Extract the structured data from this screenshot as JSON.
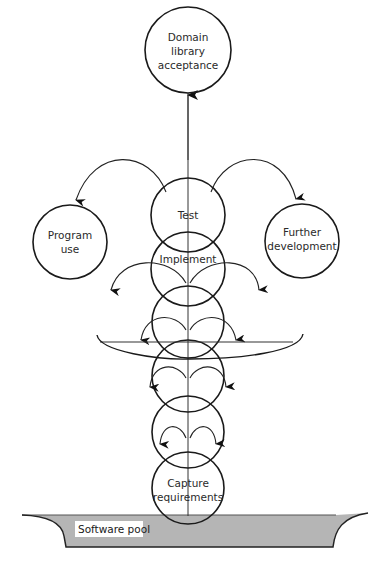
{
  "diagram": {
    "nodes": {
      "top": {
        "lines": [
          "Domain",
          "library",
          "acceptance"
        ]
      },
      "program_use": {
        "lines": [
          "Program",
          "use"
        ]
      },
      "further_development": {
        "lines": [
          "Further",
          "development"
        ]
      },
      "test": {
        "label": "Test"
      },
      "implement": {
        "label": "Implement"
      },
      "capture": {
        "lines": [
          "Capture",
          "requirements"
        ]
      }
    },
    "pool": {
      "label": "Software pool",
      "fill": "#b3b3b3"
    },
    "colors": {
      "stroke": "#1a1a1a",
      "background": "#ffffff"
    }
  }
}
